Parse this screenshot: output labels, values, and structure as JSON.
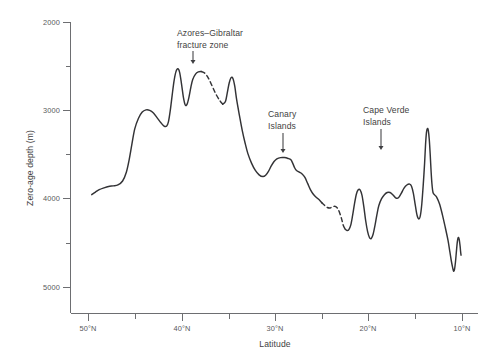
{
  "chart_data": {
    "type": "line",
    "title": "",
    "xlabel": "Latitude",
    "ylabel": "Zero-age depth (m)",
    "xlim": [
      50,
      10
    ],
    "ylim": [
      5000,
      2000
    ],
    "y_inverted": true,
    "grid": false,
    "legend": null,
    "x_axis": {
      "label": "Latitude",
      "major_ticks": [
        50,
        40,
        30,
        20,
        10
      ],
      "major_tick_labels": [
        "50°N",
        "40°N",
        "30°N",
        "20°N",
        "10°N"
      ],
      "minor_ticks": [
        45,
        35,
        25,
        15
      ],
      "direction": "decreasing-left-to-right"
    },
    "y_axis": {
      "label": "Zero-age depth (m)",
      "major_ticks": [
        2000,
        3000,
        4000,
        5000
      ],
      "major_tick_labels": [
        "2000",
        "3000",
        "4000",
        "5000"
      ],
      "minor_ticks": [
        2500,
        3500,
        4500
      ],
      "units": "m",
      "direction": "depth-increasing-downward"
    },
    "series": [
      {
        "name": "Zero-age depth profile",
        "style": "solid",
        "color": "#333336",
        "points": [
          [
            49.6,
            3955
          ],
          [
            49.2,
            3925
          ],
          [
            48.8,
            3898
          ],
          [
            48.3,
            3878
          ],
          [
            47.8,
            3862
          ],
          [
            47.3,
            3855
          ],
          [
            46.8,
            3845
          ],
          [
            46.3,
            3800
          ],
          [
            45.9,
            3700
          ],
          [
            45.6,
            3560
          ],
          [
            45.3,
            3380
          ],
          [
            45.0,
            3210
          ],
          [
            44.6,
            3090
          ],
          [
            44.2,
            3020
          ],
          [
            43.8,
            2995
          ],
          [
            43.4,
            3000
          ],
          [
            43.0,
            3030
          ],
          [
            42.6,
            3085
          ],
          [
            42.2,
            3140
          ],
          [
            41.9,
            3175
          ],
          [
            41.6,
            3180
          ],
          [
            41.4,
            3130
          ],
          [
            41.2,
            3000
          ],
          [
            41.0,
            2830
          ],
          [
            40.8,
            2670
          ],
          [
            40.6,
            2565
          ],
          [
            40.4,
            2530
          ],
          [
            40.2,
            2570
          ],
          [
            40.0,
            2700
          ],
          [
            39.8,
            2850
          ],
          [
            39.6,
            2940
          ],
          [
            39.4,
            2930
          ],
          [
            39.2,
            2850
          ],
          [
            39.0,
            2740
          ],
          [
            38.8,
            2650
          ],
          [
            38.5,
            2590
          ],
          [
            38.2,
            2565
          ],
          [
            37.9,
            2560
          ]
        ]
      },
      {
        "name": "Azores-Gibraltar fracture zone gap",
        "style": "dashed",
        "color": "#333336",
        "points": [
          [
            37.9,
            2560
          ],
          [
            37.5,
            2580
          ],
          [
            37.1,
            2640
          ],
          [
            36.7,
            2730
          ],
          [
            36.3,
            2820
          ],
          [
            35.9,
            2890
          ],
          [
            35.6,
            2930
          ]
        ]
      },
      {
        "name": "Zero-age depth profile (continued)",
        "style": "solid",
        "color": "#333336",
        "points": [
          [
            35.6,
            2930
          ],
          [
            35.3,
            2900
          ],
          [
            35.1,
            2800
          ],
          [
            34.9,
            2690
          ],
          [
            34.7,
            2630
          ],
          [
            34.5,
            2640
          ],
          [
            34.3,
            2730
          ],
          [
            34.1,
            2880
          ],
          [
            33.8,
            3060
          ],
          [
            33.5,
            3230
          ],
          [
            33.2,
            3370
          ],
          [
            32.9,
            3490
          ],
          [
            32.5,
            3600
          ],
          [
            32.1,
            3680
          ],
          [
            31.7,
            3730
          ],
          [
            31.3,
            3750
          ],
          [
            31.0,
            3735
          ],
          [
            30.7,
            3690
          ],
          [
            30.4,
            3630
          ],
          [
            30.1,
            3580
          ],
          [
            29.8,
            3550
          ],
          [
            29.4,
            3535
          ],
          [
            29.0,
            3535
          ],
          [
            28.6,
            3545
          ],
          [
            28.3,
            3560
          ],
          [
            28.1,
            3600
          ],
          [
            27.9,
            3650
          ],
          [
            27.7,
            3680
          ],
          [
            27.4,
            3700
          ],
          [
            27.1,
            3720
          ],
          [
            26.8,
            3760
          ],
          [
            26.5,
            3830
          ],
          [
            26.2,
            3900
          ],
          [
            25.9,
            3950
          ],
          [
            25.6,
            3985
          ],
          [
            25.3,
            4010
          ],
          [
            25.0,
            4045
          ]
        ]
      },
      {
        "name": "Second data gap",
        "style": "dashed",
        "color": "#333336",
        "points": [
          [
            25.0,
            4045
          ],
          [
            24.7,
            4075
          ],
          [
            24.4,
            4100
          ],
          [
            24.1,
            4105
          ],
          [
            23.8,
            4090
          ],
          [
            23.5,
            4090
          ],
          [
            23.2,
            4130
          ],
          [
            22.9,
            4220
          ],
          [
            22.7,
            4300
          ],
          [
            22.5,
            4345
          ]
        ]
      },
      {
        "name": "Zero-age depth profile (southern section)",
        "style": "solid",
        "color": "#333336",
        "points": [
          [
            22.5,
            4345
          ],
          [
            22.3,
            4360
          ],
          [
            22.1,
            4350
          ],
          [
            21.9,
            4300
          ],
          [
            21.7,
            4190
          ],
          [
            21.5,
            4060
          ],
          [
            21.3,
            3950
          ],
          [
            21.1,
            3900
          ],
          [
            20.9,
            3900
          ],
          [
            20.7,
            3960
          ],
          [
            20.5,
            4090
          ],
          [
            20.3,
            4250
          ],
          [
            20.1,
            4370
          ],
          [
            19.9,
            4440
          ],
          [
            19.7,
            4450
          ],
          [
            19.5,
            4400
          ],
          [
            19.3,
            4300
          ],
          [
            19.1,
            4180
          ],
          [
            18.9,
            4080
          ],
          [
            18.6,
            4000
          ],
          [
            18.3,
            3955
          ],
          [
            18.0,
            3930
          ],
          [
            17.7,
            3930
          ],
          [
            17.4,
            3955
          ],
          [
            17.1,
            3990
          ],
          [
            16.8,
            3990
          ],
          [
            16.5,
            3940
          ],
          [
            16.2,
            3880
          ],
          [
            15.9,
            3845
          ],
          [
            15.6,
            3835
          ],
          [
            15.4,
            3860
          ],
          [
            15.2,
            3940
          ],
          [
            15.0,
            4070
          ],
          [
            14.8,
            4190
          ],
          [
            14.6,
            4230
          ],
          [
            14.45,
            4190
          ],
          [
            14.3,
            4060
          ],
          [
            14.15,
            3850
          ],
          [
            14.0,
            3600
          ],
          [
            13.9,
            3390
          ],
          [
            13.8,
            3250
          ],
          [
            13.7,
            3205
          ],
          [
            13.6,
            3230
          ],
          [
            13.5,
            3330
          ],
          [
            13.4,
            3500
          ],
          [
            13.3,
            3700
          ],
          [
            13.2,
            3850
          ],
          [
            13.1,
            3930
          ],
          [
            12.9,
            3960
          ],
          [
            12.7,
            3985
          ],
          [
            12.4,
            4060
          ],
          [
            12.1,
            4180
          ],
          [
            11.8,
            4320
          ],
          [
            11.5,
            4470
          ],
          [
            11.3,
            4600
          ],
          [
            11.15,
            4700
          ],
          [
            11.0,
            4780
          ],
          [
            10.9,
            4820
          ],
          [
            10.8,
            4800
          ],
          [
            10.7,
            4720
          ],
          [
            10.6,
            4600
          ],
          [
            10.5,
            4490
          ],
          [
            10.4,
            4440
          ],
          [
            10.3,
            4460
          ],
          [
            10.2,
            4540
          ],
          [
            10.15,
            4600
          ],
          [
            10.1,
            4640
          ]
        ]
      }
    ],
    "annotations": [
      {
        "name": "azores-gibraltar",
        "lines": [
          "Azores–Gibraltar",
          "fracture zone"
        ],
        "text_x": 177,
        "text_y": 36,
        "arrow_x": 193,
        "arrow_y_from": 51,
        "arrow_y_to": 64,
        "align": "start"
      },
      {
        "name": "canary-islands",
        "lines": [
          "Canary",
          "Islands"
        ],
        "text_x": 268,
        "text_y": 117,
        "arrow_x": 283,
        "arrow_y_from": 133,
        "arrow_y_to": 153,
        "align": "start"
      },
      {
        "name": "cape-verde-islands",
        "lines": [
          "Cape Verde",
          "Islands"
        ],
        "text_x": 363,
        "text_y": 113,
        "arrow_x": 381,
        "arrow_y_from": 129,
        "arrow_y_to": 150,
        "align": "start"
      }
    ]
  },
  "axis_text": {
    "y_title": "Zero-age depth (m)",
    "x_title": "Latitude",
    "y_labels": [
      "2000",
      "3000",
      "4000",
      "5000"
    ],
    "x_labels": [
      "50°N",
      "40°N",
      "30°N",
      "20°N",
      "10°N"
    ]
  },
  "colors": {
    "curve": "#333336",
    "axis": "#6d6e71",
    "text": "#3f3f42",
    "tick_text": "#58595b",
    "background": "#ffffff"
  }
}
